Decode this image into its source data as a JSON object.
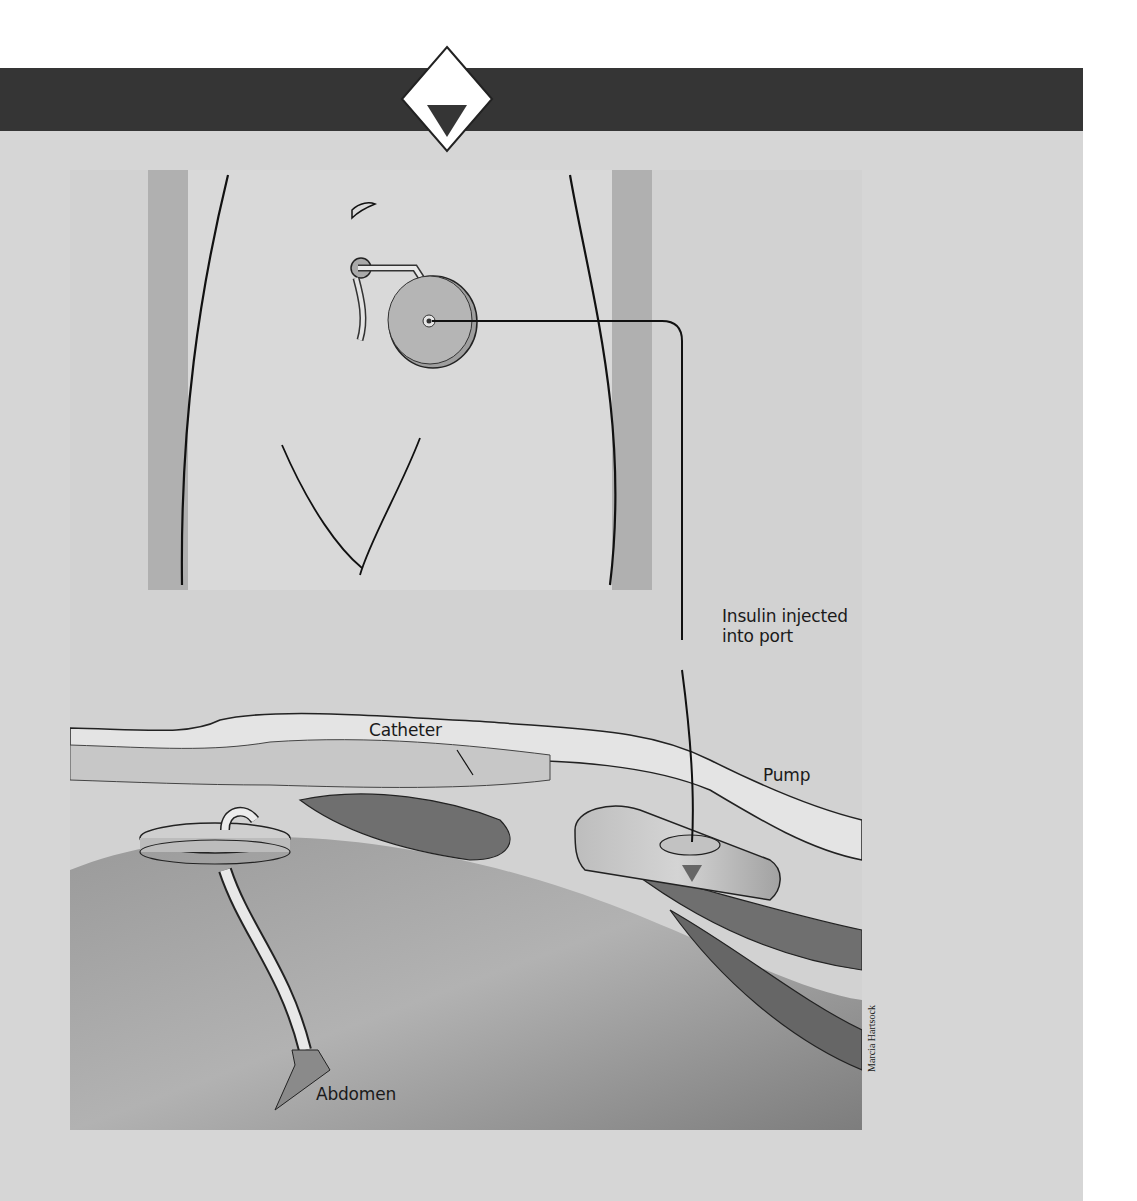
{
  "figure": {
    "header_marker": "diamond-down-triangle",
    "colors": {
      "band": "#353535",
      "panel": "#d6d6d6",
      "skin": "#d9d9d9",
      "skin_shadow": "#b4b4b4",
      "muscle": "#6f6f6f",
      "device": "#a8a8a8",
      "line": "#111111"
    },
    "labels": {
      "injection_line1": "Insulin injected",
      "injection_line2": "into port",
      "catheter": "Catheter",
      "pump": "Pump",
      "abdomen": "Abdomen"
    },
    "credit": "Marcia Hartsock"
  }
}
